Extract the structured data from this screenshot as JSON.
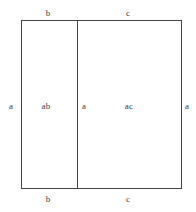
{
  "figure": {
    "kind": "area-model-rectangle-diagram",
    "width_px": 196,
    "height_px": 212,
    "background_color": "#ffffff",
    "line_color": "#444444",
    "text_color": "#3a3a3a"
  },
  "labels": {
    "top_left": "b",
    "top_right": "c",
    "left_side": "a",
    "left_region_area": "ab",
    "divider": "a",
    "right_region_area": "ac",
    "right_side": "a",
    "bottom_left": "b",
    "bottom_right": "c"
  },
  "chart_data": {
    "type": "diagram",
    "title": "",
    "outer_rectangle": {
      "x": 21,
      "y": 20,
      "width": 160,
      "height": 168,
      "height_label": "a",
      "width_labels": [
        "b",
        "c"
      ]
    },
    "divider": {
      "orientation": "vertical",
      "x": 77,
      "label": "a"
    },
    "regions": [
      {
        "name": "left-region",
        "x": 21,
        "width": 56,
        "top_label": "b",
        "bottom_label": "c_not_applicable",
        "area_label": "ab"
      },
      {
        "name": "right-region",
        "x": 77,
        "width": 104,
        "top_label": "c",
        "area_label": "ac"
      }
    ],
    "edge_labels": {
      "top": [
        "b",
        "c"
      ],
      "bottom": [
        "b",
        "c"
      ],
      "left": [
        "a"
      ],
      "right": [
        "a"
      ],
      "interior": [
        "ab",
        "a",
        "ac"
      ]
    }
  }
}
